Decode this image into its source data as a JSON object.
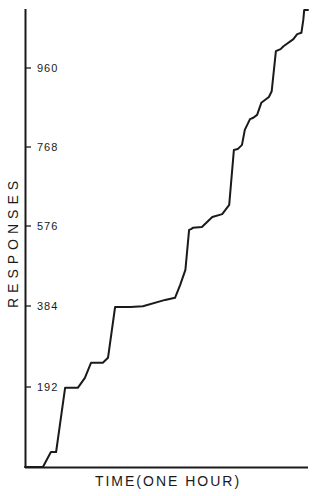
{
  "chart_data": {
    "type": "line",
    "title": "",
    "xlabel": "TIME (ONE HOUR)",
    "ylabel": "RESPONSES",
    "xlim": [
      0,
      60
    ],
    "ylim": [
      0,
      1080
    ],
    "yticks": [
      192,
      384,
      576,
      768,
      960
    ],
    "ytick_labels": [
      "192",
      "384",
      "576",
      "768",
      "960"
    ],
    "grid": false,
    "legend": null,
    "style": "cumulative record (stepped curve)",
    "series": [
      {
        "name": "Cumulative responses",
        "x_minutes": [
          0,
          3.8,
          5.5,
          6.6,
          8.5,
          11.2,
          12.7,
          14.0,
          16.5,
          17.6,
          19.1,
          20.6,
          22.3,
          25.0,
          29.7,
          31.8,
          32.9,
          34.0,
          34.8,
          35.2,
          35.6,
          37.5,
          38.6,
          39.7,
          41.8,
          43.3,
          44.3,
          45.1,
          46.0,
          46.6,
          47.7,
          48.4,
          49.2,
          50.1,
          51.7,
          52.3,
          53.2,
          54.2,
          54.8,
          56.9,
          57.7,
          58.6,
          59.0,
          59.2,
          60.0
        ],
        "y_responses": [
          0,
          0,
          36,
          36,
          190,
          190,
          214,
          250,
          250,
          262,
          384,
          384,
          384,
          386,
          401,
          406,
          437,
          473,
          569,
          571,
          574,
          576,
          588,
          600,
          607,
          629,
          761,
          763,
          773,
          809,
          835,
          838,
          845,
          874,
          888,
          902,
          998,
          1003,
          1010,
          1027,
          1039,
          1042,
          1073,
          1097,
          1097
        ]
      }
    ]
  },
  "labels": {
    "y_axis": "RESPONSES",
    "x_axis": "TIME(ONE HOUR)",
    "ticks": [
      "192",
      "384",
      "576",
      "768",
      "960"
    ]
  }
}
